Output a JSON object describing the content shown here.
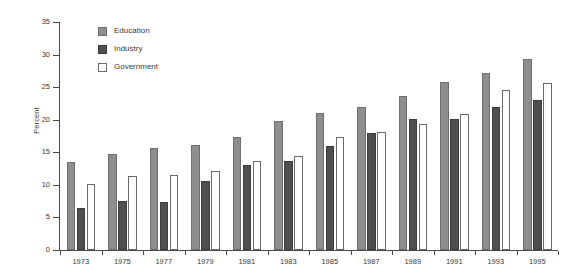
{
  "chart_data": {
    "type": "bar",
    "title": "",
    "xlabel": "",
    "ylabel": "Percent",
    "ylim": [
      0,
      35
    ],
    "yticks": [
      0,
      5,
      10,
      15,
      20,
      25,
      30,
      35
    ],
    "grid": false,
    "legend_position": "upper-left-inside",
    "categories": [
      "1973",
      "1975",
      "1977",
      "1979",
      "1981",
      "1983",
      "1985",
      "1987",
      "1989",
      "1991",
      "1993",
      "1995"
    ],
    "series": [
      {
        "name": "Education",
        "color": "#8e8e8e",
        "values": [
          13.5,
          14.7,
          15.6,
          16.1,
          17.3,
          19.8,
          21.1,
          22.0,
          23.7,
          25.8,
          27.1,
          29.3
        ]
      },
      {
        "name": "Industry",
        "color": "#4f4f4f",
        "values": [
          6.4,
          7.6,
          7.4,
          10.6,
          13.1,
          13.7,
          15.9,
          18.0,
          20.1,
          20.1,
          22.0,
          23.0
        ]
      },
      {
        "name": "Government",
        "color": "#ffffff",
        "values": [
          10.2,
          11.4,
          11.5,
          12.2,
          13.7,
          14.4,
          17.4,
          18.1,
          19.4,
          20.9,
          24.5,
          25.6
        ]
      }
    ]
  },
  "axes": {
    "y_label": "Percent",
    "y_tick_labels": [
      "0",
      "5",
      "10",
      "15",
      "20",
      "25",
      "30",
      "35"
    ],
    "x_tick_labels": [
      "1973",
      "1975",
      "1977",
      "1979",
      "1981",
      "1983",
      "1985",
      "1987",
      "1989",
      "1991",
      "1993",
      "1995"
    ]
  },
  "legend": {
    "items": [
      {
        "label": "Education",
        "swatch": "education"
      },
      {
        "label": "Industry",
        "swatch": "industry"
      },
      {
        "label": "Government",
        "swatch": "government"
      }
    ]
  }
}
